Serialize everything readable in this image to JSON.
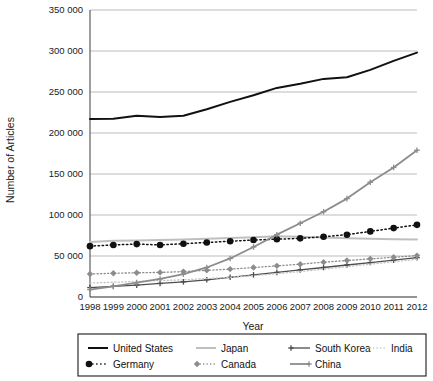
{
  "chart_data": {
    "type": "line",
    "title": "",
    "xlabel": "Year",
    "ylabel": "Number of Articles",
    "x": [
      1998,
      1999,
      2000,
      2001,
      2002,
      2003,
      2004,
      2005,
      2006,
      2007,
      2008,
      2009,
      2010,
      2011,
      2012
    ],
    "xtick_labels": [
      "1998",
      "1999",
      "2000",
      "2001",
      "2002",
      "2003",
      "2004",
      "2005",
      "2006",
      "2007",
      "2008",
      "2009",
      "2010",
      "2011",
      "2012"
    ],
    "ytick_labels": [
      "0",
      "50 000",
      "100 000",
      "150 000",
      "200 000",
      "250 000",
      "300 000",
      "350 000"
    ],
    "ytick_values": [
      0,
      50000,
      100000,
      150000,
      200000,
      250000,
      300000,
      350000
    ],
    "ylim": [
      0,
      350000
    ],
    "xlim": [
      1998,
      2012
    ],
    "grid": "horizontal",
    "legend_position": "bottom",
    "series": [
      {
        "name": "United States",
        "color": "#111111",
        "style": "solid",
        "width": 2.0,
        "marker": "none",
        "values": [
          217000,
          217500,
          221000,
          219500,
          221000,
          229000,
          238000,
          246000,
          255000,
          260000,
          266000,
          268000,
          277000,
          288000,
          298000
        ]
      },
      {
        "name": "Japan",
        "color": "#bfbfbf",
        "style": "solid",
        "width": 2.0,
        "marker": "none",
        "values": [
          67000,
          68500,
          69000,
          69500,
          70000,
          71000,
          72000,
          73000,
          74000,
          73500,
          72500,
          71500,
          71000,
          70500,
          70000
        ]
      },
      {
        "name": "South Korea",
        "color": "#4d4d4d",
        "style": "solid",
        "width": 1.3,
        "marker": "plus",
        "values": [
          11500,
          13000,
          14500,
          16500,
          18500,
          21000,
          24000,
          27000,
          30000,
          33000,
          36000,
          39000,
          42000,
          45000,
          48000
        ]
      },
      {
        "name": "India",
        "color": "#c4c4c4",
        "style": "dotted",
        "width": 1.3,
        "marker": "none",
        "values": [
          17000,
          18000,
          19000,
          20000,
          21000,
          22500,
          24000,
          26000,
          28500,
          31000,
          34000,
          37000,
          40000,
          43000,
          46000
        ]
      },
      {
        "name": "Germany",
        "color": "#111111",
        "style": "dotted",
        "width": 1.5,
        "marker": "circle",
        "values": [
          62000,
          63500,
          64500,
          63500,
          65000,
          66500,
          68000,
          69500,
          70500,
          71500,
          73500,
          76000,
          80000,
          84000,
          88000
        ]
      },
      {
        "name": "Canada",
        "color": "#8c8c8c",
        "style": "dotted",
        "width": 1.3,
        "marker": "diamond",
        "values": [
          28000,
          29000,
          29500,
          30000,
          31000,
          32500,
          34000,
          36000,
          38000,
          40000,
          42500,
          44500,
          46500,
          48500,
          50500
        ]
      },
      {
        "name": "China",
        "color": "#8c8c8c",
        "style": "solid",
        "width": 1.8,
        "marker": "plus",
        "values": [
          9000,
          13000,
          17500,
          22000,
          28000,
          36000,
          47000,
          61000,
          76000,
          90000,
          104000,
          120000,
          140000,
          158000,
          179000
        ]
      }
    ]
  },
  "legend": {
    "entries": [
      {
        "label": "United States"
      },
      {
        "label": "Japan"
      },
      {
        "label": "South Korea"
      },
      {
        "label": "India"
      },
      {
        "label": "Germany"
      },
      {
        "label": "Canada"
      },
      {
        "label": "China"
      }
    ]
  }
}
